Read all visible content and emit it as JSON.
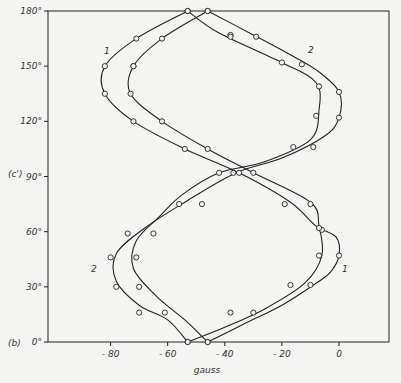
{
  "chart_data": {
    "type": "line",
    "title": "",
    "panel_label": "(b)",
    "ylabel": "(c')",
    "xlabel": "gauss",
    "xlim": [
      -98,
      16
    ],
    "ylim": [
      0,
      180
    ],
    "x_ticks": [
      -80,
      -60,
      -40,
      -20,
      0
    ],
    "x_tick_labels": [
      "- 80",
      "- 60",
      "- 40",
      "- 20",
      "0"
    ],
    "y_ticks": [
      0,
      30,
      60,
      90,
      120,
      150,
      180
    ],
    "y_tick_labels": [
      "0°",
      "30°",
      "60°",
      "90°",
      "120°",
      "150°",
      "180°"
    ],
    "grid": false,
    "series": [
      {
        "name": "1",
        "label_positions": [
          {
            "x": -82,
            "y": 156
          },
          {
            "x": -1,
            "y": 38
          }
        ],
        "points": [
          [
            -53,
            180
          ],
          [
            -71,
            165
          ],
          [
            -82,
            150
          ],
          [
            -82,
            135
          ],
          [
            -72,
            120
          ],
          [
            -54,
            105
          ],
          [
            -35,
            92
          ],
          [
            -17,
            76
          ],
          [
            -8,
            63
          ],
          [
            -1,
            57
          ],
          [
            0,
            47
          ],
          [
            -3,
            38
          ],
          [
            -8,
            32
          ],
          [
            -20,
            20
          ],
          [
            -33,
            10
          ],
          [
            -46,
            0
          ]
        ],
        "markers": [
          [
            -53,
            180
          ],
          [
            -71,
            165
          ],
          [
            -82,
            150
          ],
          [
            -82,
            135
          ],
          [
            -72,
            120
          ],
          [
            -54,
            105
          ],
          [
            -35,
            92
          ],
          [
            -19,
            75
          ],
          [
            -6,
            61
          ],
          [
            0,
            47
          ],
          [
            -10,
            31
          ],
          [
            -30,
            16
          ],
          [
            -46,
            0
          ]
        ]
      },
      {
        "name": "2",
        "label_positions": [
          {
            "x": -84,
            "y": 40
          },
          {
            "x": -4,
            "y": 157
          }
        ],
        "points": [
          [
            -46,
            180
          ],
          [
            -30,
            167
          ],
          [
            -18,
            157
          ],
          [
            -8,
            148
          ],
          [
            0,
            136
          ],
          [
            0,
            122
          ],
          [
            -5,
            112
          ],
          [
            -20,
            100
          ],
          [
            -36,
            92
          ],
          [
            -54,
            76
          ],
          [
            -68,
            62
          ],
          [
            -78,
            48
          ],
          [
            -78,
            33
          ],
          [
            -70,
            20
          ],
          [
            -60,
            12
          ],
          [
            -53,
            0
          ]
        ],
        "markers": [
          [
            -46,
            180
          ],
          [
            -29,
            166
          ],
          [
            -13,
            151
          ],
          [
            0,
            136
          ],
          [
            0,
            122
          ],
          [
            -9,
            106
          ],
          [
            -37,
            92
          ],
          [
            -56,
            75
          ],
          [
            -74,
            59
          ],
          [
            -80,
            46
          ],
          [
            -78,
            30
          ],
          [
            -70,
            16
          ],
          [
            -53,
            0
          ]
        ]
      },
      {
        "name": "1 (inner)",
        "points": [
          [
            -46,
            180
          ],
          [
            -62,
            165
          ],
          [
            -72,
            150
          ],
          [
            -73,
            135
          ],
          [
            -62,
            120
          ],
          [
            -46,
            105
          ],
          [
            -30,
            92
          ],
          [
            -10,
            76
          ],
          [
            -7,
            63
          ],
          [
            -6,
            47
          ],
          [
            -12,
            32
          ],
          [
            -26,
            18
          ],
          [
            -40,
            8
          ],
          [
            -53,
            0
          ]
        ],
        "markers": [
          [
            -46,
            180
          ],
          [
            -62,
            165
          ],
          [
            -72,
            150
          ],
          [
            -73,
            135
          ],
          [
            -62,
            120
          ],
          [
            -46,
            105
          ],
          [
            -30,
            92
          ],
          [
            -10,
            75
          ],
          [
            -7,
            62
          ],
          [
            -7,
            47
          ],
          [
            -17,
            31
          ],
          [
            -38,
            16
          ],
          [
            -53,
            0
          ]
        ]
      },
      {
        "name": "2 (inner)",
        "points": [
          [
            -53,
            180
          ],
          [
            -42,
            168
          ],
          [
            -20,
            152
          ],
          [
            -8,
            141
          ],
          [
            -7,
            126
          ],
          [
            -10,
            110
          ],
          [
            -26,
            98
          ],
          [
            -42,
            92
          ],
          [
            -55,
            80
          ],
          [
            -63,
            68
          ],
          [
            -71,
            55
          ],
          [
            -72,
            40
          ],
          [
            -64,
            25
          ],
          [
            -54,
            12
          ],
          [
            -46,
            0
          ]
        ],
        "markers": [
          [
            -53,
            180
          ],
          [
            -38,
            167
          ],
          [
            -20,
            152
          ],
          [
            -7,
            139
          ],
          [
            -8,
            123
          ],
          [
            -16,
            106
          ],
          [
            -42,
            92
          ],
          [
            -48,
            75
          ],
          [
            -65,
            59
          ],
          [
            -71,
            46
          ],
          [
            -70,
            30
          ],
          [
            -61,
            16
          ],
          [
            -46,
            0
          ]
        ]
      }
    ]
  }
}
